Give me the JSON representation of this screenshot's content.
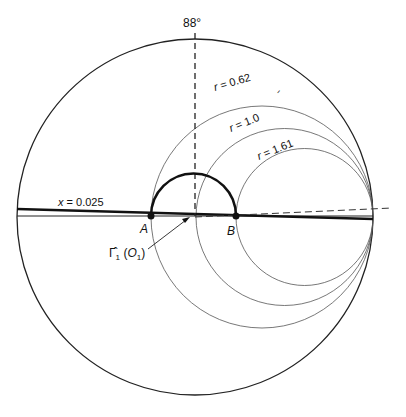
{
  "diagram": {
    "type": "smith-chart",
    "angle_label": "88°",
    "reactance_label": "x = 0.025",
    "resistance_circles": [
      {
        "label": "r = 0.62",
        "cx": 261.5,
        "r": 112
      },
      {
        "label": "r = 1.0",
        "cx": 284.5,
        "r": 89
      },
      {
        "label": "r = 1.61",
        "cx": 304.5,
        "r": 69
      }
    ],
    "points": [
      {
        "label": "A",
        "x": 151,
        "y": 216
      },
      {
        "label": "B",
        "x": 236,
        "y": 216
      }
    ],
    "pointer_label": "Γ̂₁ (O₁)",
    "small_mark": "ᐟ",
    "colors": {
      "line": "#111111",
      "thin": "#444444",
      "background": "#ffffff"
    }
  }
}
